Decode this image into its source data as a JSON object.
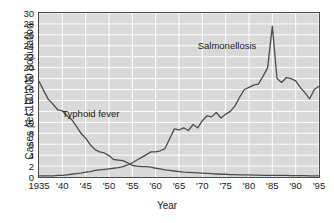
{
  "chart_data": {
    "type": "line",
    "title": "",
    "xlabel": "Year",
    "ylabel": "Cases per 100,000 population",
    "xlim": [
      1935,
      1995
    ],
    "ylim": [
      0,
      30
    ],
    "grid": true,
    "legend_position": "inline-annotations",
    "plot_background": "#d9d9d9",
    "gridline_color": "#ffffff",
    "line_color": "#4d4d4d",
    "xticks": [
      "1935",
      "'40",
      "'45",
      "'50",
      "'55",
      "'60",
      "'65",
      "'70",
      "'75",
      "'80",
      "'85",
      "'90",
      "'95"
    ],
    "xtick_values": [
      1935,
      1940,
      1945,
      1950,
      1955,
      1960,
      1965,
      1970,
      1975,
      1980,
      1985,
      1990,
      1995
    ],
    "yticks": [
      "0",
      "2",
      "4",
      "6",
      "8",
      "10",
      "12",
      "14",
      "16",
      "18",
      "20",
      "22",
      "24",
      "26",
      "28",
      "30"
    ],
    "ytick_values": [
      0,
      2,
      4,
      6,
      8,
      10,
      12,
      14,
      16,
      18,
      20,
      22,
      24,
      26,
      28,
      30
    ],
    "annotations": [
      {
        "text": "Typhoid fever",
        "x": 1940,
        "y": 11.5
      },
      {
        "text": "Salmonellosis",
        "x": 1969,
        "y": 24.0
      }
    ],
    "series": [
      {
        "name": "Typhoid fever",
        "x": [
          1935,
          1936,
          1937,
          1938,
          1939,
          1940,
          1941,
          1942,
          1943,
          1944,
          1945,
          1946,
          1947,
          1948,
          1949,
          1950,
          1951,
          1952,
          1953,
          1954,
          1955,
          1956,
          1957,
          1958,
          1959,
          1960,
          1961,
          1962,
          1963,
          1964,
          1965,
          1966,
          1967,
          1968,
          1969,
          1970,
          1971,
          1972,
          1973,
          1974,
          1975,
          1976,
          1977,
          1978,
          1979,
          1980,
          1981,
          1982,
          1983,
          1984,
          1985,
          1986,
          1987,
          1988,
          1989,
          1990,
          1991,
          1992,
          1993,
          1994,
          1995
        ],
        "values": [
          17.5,
          15.8,
          14.2,
          13.3,
          12.3,
          12.1,
          11.2,
          10.5,
          9.3,
          8.0,
          7.1,
          5.9,
          5.0,
          4.6,
          4.4,
          3.9,
          3.2,
          3.1,
          3.0,
          2.6,
          2.1,
          2.0,
          1.9,
          1.9,
          1.8,
          1.6,
          1.5,
          1.3,
          1.2,
          1.1,
          1.0,
          0.9,
          0.85,
          0.8,
          0.75,
          0.7,
          0.65,
          0.6,
          0.55,
          0.5,
          0.5,
          0.45,
          0.45,
          0.4,
          0.4,
          0.4,
          0.35,
          0.35,
          0.3,
          0.3,
          0.3,
          0.3,
          0.3,
          0.3,
          0.25,
          0.25,
          0.25,
          0.25,
          0.2,
          0.2,
          0.2
        ]
      },
      {
        "name": "Salmonellosis",
        "x": [
          1935,
          1936,
          1937,
          1938,
          1939,
          1940,
          1941,
          1942,
          1943,
          1944,
          1945,
          1946,
          1947,
          1948,
          1949,
          1950,
          1951,
          1952,
          1953,
          1954,
          1955,
          1956,
          1957,
          1958,
          1959,
          1960,
          1961,
          1962,
          1963,
          1964,
          1965,
          1966,
          1967,
          1968,
          1969,
          1970,
          1971,
          1972,
          1973,
          1974,
          1975,
          1976,
          1977,
          1978,
          1979,
          1980,
          1981,
          1982,
          1983,
          1984,
          1985,
          1986,
          1987,
          1988,
          1989,
          1990,
          1991,
          1992,
          1993,
          1994,
          1995
        ],
        "values": [
          0.2,
          0.2,
          0.2,
          0.2,
          0.3,
          0.3,
          0.4,
          0.5,
          0.6,
          0.7,
          0.9,
          1.0,
          1.2,
          1.3,
          1.4,
          1.5,
          1.6,
          1.7,
          1.9,
          2.2,
          2.6,
          3.1,
          3.6,
          4.1,
          4.6,
          4.6,
          4.8,
          5.2,
          7.0,
          8.8,
          8.6,
          9.0,
          8.5,
          9.6,
          9.0,
          10.3,
          11.2,
          11.0,
          11.8,
          10.8,
          11.5,
          12.0,
          13.0,
          14.6,
          16.0,
          16.4,
          16.8,
          17.0,
          18.4,
          20.0,
          27.6,
          18.0,
          17.3,
          18.2,
          18.0,
          17.6,
          16.4,
          15.4,
          14.3,
          16.0,
          16.6
        ]
      }
    ]
  }
}
